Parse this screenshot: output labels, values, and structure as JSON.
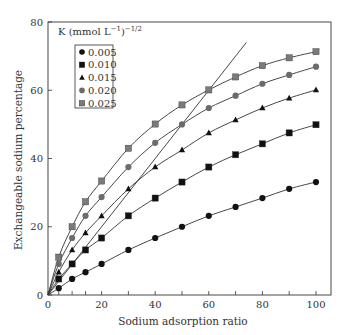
{
  "chart_data": {
    "type": "line",
    "title": "",
    "xlabel": "Sodium adsorption ratio",
    "ylabel": "Exchangeable sodium percentage",
    "xlim": [
      0,
      105.6
    ],
    "ylim": [
      0,
      80
    ],
    "x_ticks": [
      0,
      20,
      40,
      60,
      80,
      100
    ],
    "x_minor_ticks": [
      4,
      9,
      14,
      30,
      50,
      70,
      90
    ],
    "y_ticks": [
      0,
      20,
      40,
      60,
      80
    ],
    "grid": false,
    "legend": {
      "title": "K (mmol L",
      "title_sup1": "−1",
      "title_mid": ")",
      "title_sup2": "−1/2",
      "placement": "top-left"
    },
    "x": [
      0,
      4,
      9,
      14,
      20,
      30,
      40,
      50,
      60,
      70,
      80,
      90,
      100
    ],
    "series": [
      {
        "name": "0.005",
        "marker": "circle",
        "color": "#111111",
        "values": [
          0,
          2.0,
          4.7,
          6.7,
          9.1,
          13.2,
          16.7,
          20.0,
          23.2,
          25.8,
          28.4,
          31.1,
          33.1
        ]
      },
      {
        "name": "0.010",
        "marker": "square",
        "color": "#111111",
        "values": [
          0,
          4.7,
          9.1,
          13.2,
          16.7,
          23.2,
          28.4,
          33.1,
          37.5,
          41.1,
          44.3,
          47.5,
          49.9
        ]
      },
      {
        "name": "0.015",
        "marker": "triangle",
        "color": "#111111",
        "values": [
          0,
          6.7,
          13.2,
          18.2,
          23.2,
          31.1,
          37.5,
          42.5,
          47.5,
          51.3,
          54.8,
          57.7,
          60.1
        ]
      },
      {
        "name": "0.020",
        "marker": "circle",
        "color": "#6b6b6b",
        "values": [
          0,
          9.1,
          16.7,
          23.2,
          28.7,
          37.5,
          44.6,
          50.0,
          54.8,
          58.4,
          61.9,
          64.5,
          66.9
        ]
      },
      {
        "name": "0.025",
        "marker": "square",
        "color": "#7a7a7a",
        "values": [
          0,
          11.1,
          20.0,
          27.3,
          33.4,
          43.0,
          50.1,
          55.7,
          60.1,
          63.9,
          67.2,
          69.5,
          71.3
        ]
      }
    ],
    "reference_line": {
      "name": "1:1 line",
      "x": [
        0,
        74
      ],
      "y": [
        0,
        74
      ]
    }
  }
}
